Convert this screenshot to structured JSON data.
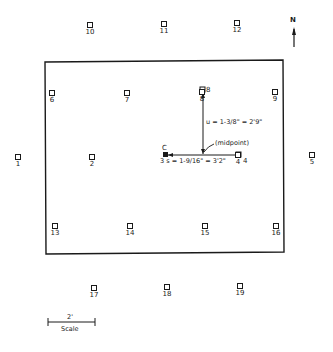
{
  "diagram": {
    "compass": {
      "label": "N"
    },
    "plot_outline": {
      "shape": "rectangle"
    },
    "markers": [
      {
        "id": "10",
        "x": 90,
        "y": 22
      },
      {
        "id": "11",
        "x": 164,
        "y": 21
      },
      {
        "id": "12",
        "x": 237,
        "y": 20
      },
      {
        "id": "6",
        "x": 52,
        "y": 90
      },
      {
        "id": "7",
        "x": 127,
        "y": 90
      },
      {
        "id": "8",
        "x": 202,
        "y": 89
      },
      {
        "id": "9",
        "x": 275,
        "y": 89
      },
      {
        "id": "1",
        "x": 18,
        "y": 154
      },
      {
        "id": "2",
        "x": 92,
        "y": 154
      },
      {
        "id": "4",
        "x": 238,
        "y": 152
      },
      {
        "id": "5",
        "x": 312,
        "y": 152
      },
      {
        "id": "13",
        "x": 55,
        "y": 223
      },
      {
        "id": "14",
        "x": 130,
        "y": 223
      },
      {
        "id": "15",
        "x": 205,
        "y": 223
      },
      {
        "id": "16",
        "x": 276,
        "y": 223
      },
      {
        "id": "17",
        "x": 94,
        "y": 285
      },
      {
        "id": "18",
        "x": 167,
        "y": 284
      },
      {
        "id": "19",
        "x": 240,
        "y": 283
      }
    ],
    "point_c": {
      "label": "C",
      "marker_id": "3"
    },
    "annotations": {
      "vertical_measure": "u = 1-3/8\" = 2'9\"",
      "midpoint": "(midpoint)",
      "horizontal_measure": "3 s = 1-9/16\" = 3'2\"",
      "label_8": "8",
      "label_4": "4"
    },
    "scale": {
      "distance": "2'",
      "caption": "Scale"
    }
  }
}
